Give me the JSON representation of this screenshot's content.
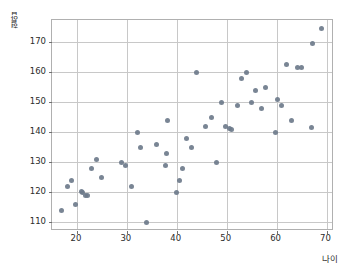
{
  "chart_data": {
    "type": "scatter",
    "title": "",
    "xlabel": "나이",
    "ylabel": "혈압",
    "xlim": [
      15.0,
      71.5
    ],
    "ylim": [
      107.0,
      177.5
    ],
    "xticks": [
      20,
      30,
      40,
      50,
      60,
      70
    ],
    "yticks": [
      110,
      120,
      130,
      140,
      150,
      160,
      170
    ],
    "grid": true,
    "legend": null,
    "marker_color": "#6e7b8b",
    "series": [
      {
        "name": "혈압",
        "points": [
          [
            17.0,
            114.0
          ],
          [
            18.2,
            121.8
          ],
          [
            19.0,
            124.0
          ],
          [
            19.8,
            116.0
          ],
          [
            20.9,
            120.2
          ],
          [
            21.2,
            120.0
          ],
          [
            21.8,
            119.0
          ],
          [
            22.2,
            119.0
          ],
          [
            23.0,
            127.8
          ],
          [
            24.0,
            130.8
          ],
          [
            25.0,
            124.8
          ],
          [
            28.9,
            130.0
          ],
          [
            29.8,
            129.0
          ],
          [
            30.9,
            121.8
          ],
          [
            32.2,
            139.8
          ],
          [
            32.8,
            134.8
          ],
          [
            34.0,
            109.8
          ],
          [
            35.9,
            136.0
          ],
          [
            37.8,
            129.0
          ],
          [
            38.0,
            132.8
          ],
          [
            38.1,
            143.8
          ],
          [
            40.0,
            119.8
          ],
          [
            40.6,
            124.0
          ],
          [
            41.2,
            127.8
          ],
          [
            42.0,
            137.8
          ],
          [
            43.0,
            134.8
          ],
          [
            44.0,
            159.8
          ],
          [
            45.8,
            141.8
          ],
          [
            47.0,
            144.8
          ],
          [
            48.0,
            129.8
          ],
          [
            49.0,
            149.8
          ],
          [
            49.8,
            141.8
          ],
          [
            50.6,
            141.2
          ],
          [
            51.0,
            140.8
          ],
          [
            52.2,
            148.8
          ],
          [
            53.0,
            157.8
          ],
          [
            54.0,
            159.8
          ],
          [
            55.0,
            149.8
          ],
          [
            55.8,
            153.8
          ],
          [
            57.0,
            147.8
          ],
          [
            57.8,
            154.8
          ],
          [
            59.8,
            139.8
          ],
          [
            60.2,
            150.8
          ],
          [
            61.0,
            148.8
          ],
          [
            62.0,
            162.5
          ],
          [
            63.0,
            143.8
          ],
          [
            64.2,
            161.5
          ],
          [
            64.9,
            161.5
          ],
          [
            67.0,
            141.5
          ],
          [
            67.2,
            169.5
          ],
          [
            69.0,
            174.5
          ]
        ]
      }
    ]
  },
  "axes": {
    "ytick_labels": [
      "170",
      "160",
      "150",
      "140",
      "130",
      "120",
      "110"
    ],
    "xtick_labels": [
      "20",
      "30",
      "40",
      "50",
      "60",
      "70"
    ]
  }
}
